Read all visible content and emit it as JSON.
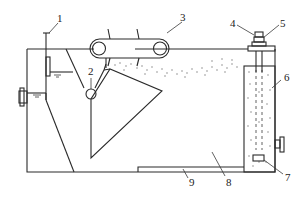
{
  "diagram": {
    "type": "schematic",
    "labels": [
      {
        "id": "1",
        "text": "1",
        "x": 57,
        "y": 22
      },
      {
        "id": "2",
        "text": "2",
        "x": 89,
        "y": 74
      },
      {
        "id": "3",
        "text": "3",
        "x": 180,
        "y": 20
      },
      {
        "id": "4",
        "text": "4",
        "x": 232,
        "y": 27
      },
      {
        "id": "5",
        "text": "5",
        "x": 280,
        "y": 27
      },
      {
        "id": "6",
        "text": "6",
        "x": 285,
        "y": 80
      },
      {
        "id": "7",
        "text": "7",
        "x": 286,
        "y": 179
      },
      {
        "id": "8",
        "text": "8",
        "x": 226,
        "y": 184
      },
      {
        "id": "9",
        "text": "9",
        "x": 190,
        "y": 184
      }
    ]
  }
}
